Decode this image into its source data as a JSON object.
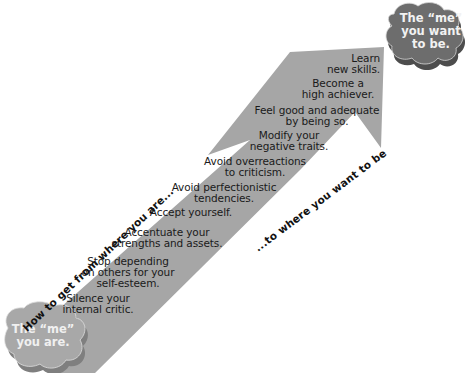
{
  "colors": {
    "arrow_fill": "#a6a6a6",
    "cloud_bottom_fill": "#a8a8a8",
    "cloud_bottom_side": "#7f7f7f",
    "cloud_top_fill": "#6d6d6d",
    "cloud_top_side": "#4d4d4d",
    "text": "#1a1a1a",
    "cloud_text": "#f2f2f2"
  },
  "start_cloud": {
    "line1": "The “me”",
    "line2": "you are."
  },
  "goal_cloud": {
    "line1": "The “me”",
    "line2": "you want",
    "line3": "to be."
  },
  "path_label_left": "How to get from where you are...",
  "path_label_right": "...to where you want to be",
  "steps": [
    {
      "line1": "Silence your",
      "line2": "internal critic."
    },
    {
      "line1": "Stop depending",
      "line2": "on others for your",
      "line3": "self-esteem."
    },
    {
      "line1": "Accentuate your",
      "line2": "strengths and assets."
    },
    {
      "line1": "Accept yourself."
    },
    {
      "line1": "Avoid perfectionistic",
      "line2": "tendencies."
    },
    {
      "line1": "Avoid overreactions",
      "line2": "to criticism."
    },
    {
      "line1": "Modify your",
      "line2": "negative traits."
    },
    {
      "line1": "Feel good and adequate",
      "line2": "by being so."
    },
    {
      "line1": "Become a",
      "line2": "high achiever."
    },
    {
      "line1": "Learn",
      "line2": "new skills."
    }
  ]
}
